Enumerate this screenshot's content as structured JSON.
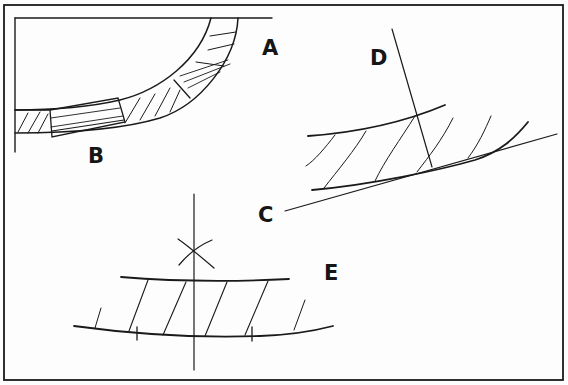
{
  "diagram": {
    "type": "technical-drawing",
    "colors": {
      "ink": "#1a1a1a",
      "paper": "#fdfdfd"
    },
    "labels": [
      {
        "id": "A",
        "text": "A"
      },
      {
        "id": "B",
        "text": "B"
      },
      {
        "id": "C",
        "text": "C"
      },
      {
        "id": "D",
        "text": "D"
      },
      {
        "id": "E",
        "text": "E"
      }
    ],
    "panels": [
      {
        "id": "A-B",
        "caption_labels": [
          "A",
          "B"
        ],
        "content": "Quarter-circle curved frame built from hatched segments with a straight block insert at the bottom (B)"
      },
      {
        "id": "C-D",
        "caption_labels": [
          "C",
          "D"
        ],
        "content": "Curved hatched strip with tangent line C and normal line D"
      },
      {
        "id": "E",
        "caption_labels": [
          "E"
        ],
        "content": "Curved hatched strip with vertical centerline and compass arc intersection (X) marking center"
      }
    ]
  }
}
